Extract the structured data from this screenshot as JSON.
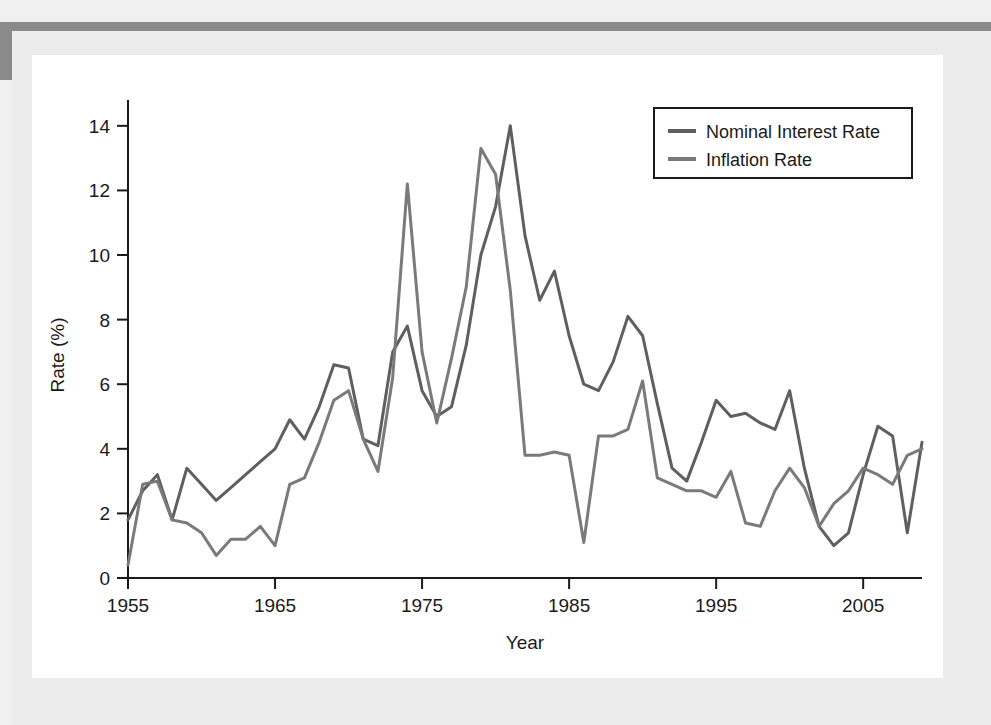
{
  "figure": {
    "background_color": "#ffffff",
    "page_color": "#ececec",
    "scan_border_color": "#8a8a8a"
  },
  "chart_data": {
    "type": "line",
    "title": "",
    "xlabel": "Year",
    "ylabel": "Rate (%)",
    "xlim": [
      1955,
      2009
    ],
    "ylim": [
      0,
      14.8
    ],
    "xticks": [
      1955,
      1965,
      1975,
      1985,
      1995,
      2005
    ],
    "yticks": [
      0,
      2,
      4,
      6,
      8,
      10,
      12,
      14
    ],
    "grid": false,
    "legend_position": "top-right",
    "x": [
      1955,
      1956,
      1957,
      1958,
      1959,
      1960,
      1961,
      1962,
      1963,
      1964,
      1965,
      1966,
      1967,
      1968,
      1969,
      1970,
      1971,
      1972,
      1973,
      1974,
      1975,
      1976,
      1977,
      1978,
      1979,
      1980,
      1981,
      1982,
      1983,
      1984,
      1985,
      1986,
      1987,
      1988,
      1989,
      1990,
      1991,
      1992,
      1993,
      1994,
      1995,
      1996,
      1997,
      1998,
      1999,
      2000,
      2001,
      2002,
      2003,
      2004,
      2005,
      2006,
      2007,
      2008,
      2009
    ],
    "series": [
      {
        "name": "Nominal Interest Rate",
        "color": "#5f5f5f",
        "values": [
          1.8,
          2.7,
          3.2,
          1.8,
          3.4,
          2.9,
          2.4,
          2.8,
          3.2,
          3.6,
          4.0,
          4.9,
          4.3,
          5.3,
          6.6,
          6.5,
          4.3,
          4.1,
          7.0,
          7.8,
          5.8,
          5.0,
          5.3,
          7.2,
          10.0,
          11.5,
          14.0,
          10.6,
          8.6,
          9.5,
          7.5,
          6.0,
          5.8,
          6.7,
          8.1,
          7.5,
          5.4,
          3.4,
          3.0,
          4.2,
          5.5,
          5.0,
          5.1,
          4.8,
          4.6,
          5.8,
          3.4,
          1.6,
          1.0,
          1.4,
          3.2,
          4.7,
          4.4,
          1.4,
          4.2
        ]
      },
      {
        "name": "Inflation Rate",
        "color": "#7a7a7a",
        "values": [
          0.4,
          2.9,
          3.0,
          1.8,
          1.7,
          1.4,
          0.7,
          1.2,
          1.2,
          1.6,
          1.0,
          2.9,
          3.1,
          4.2,
          5.5,
          5.8,
          4.3,
          3.3,
          6.2,
          12.2,
          7.0,
          4.8,
          6.8,
          9.0,
          13.3,
          12.5,
          8.9,
          3.8,
          3.8,
          3.9,
          3.8,
          1.1,
          4.4,
          4.4,
          4.6,
          6.1,
          3.1,
          2.9,
          2.7,
          2.7,
          2.5,
          3.3,
          1.7,
          1.6,
          2.7,
          3.4,
          2.8,
          1.6,
          2.3,
          2.7,
          3.4,
          3.2,
          2.9,
          3.8,
          4.0
        ]
      }
    ]
  },
  "legend": {
    "entries": [
      {
        "label": "Nominal Interest Rate",
        "color": "#5f5f5f"
      },
      {
        "label": "Inflation Rate",
        "color": "#7a7a7a"
      }
    ]
  },
  "axes": {
    "x_title": "Year",
    "y_title": "Rate (%)",
    "x_tick_labels": [
      "1955",
      "1965",
      "1975",
      "1985",
      "1995",
      "2005"
    ],
    "y_tick_labels": [
      "0",
      "2",
      "4",
      "6",
      "8",
      "10",
      "12",
      "14"
    ]
  }
}
